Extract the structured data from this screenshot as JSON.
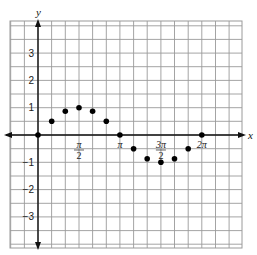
{
  "chart_data": {
    "type": "scatter",
    "title": "",
    "xlabel": "x",
    "ylabel": "y",
    "grid": true,
    "x_ticks": [
      {
        "value": 1.5708,
        "label_num": "π",
        "label_den": "2"
      },
      {
        "value": 3.1416,
        "label": "π"
      },
      {
        "value": 4.7124,
        "label_num": "3π",
        "label_den": "2"
      },
      {
        "value": 6.2832,
        "label": "2π"
      }
    ],
    "y_ticks": [
      {
        "value": 3,
        "label": "3"
      },
      {
        "value": 2,
        "label": "2"
      },
      {
        "value": 1,
        "label": "1"
      },
      {
        "value": -1,
        "label": "−1"
      },
      {
        "value": -2,
        "label": "−2"
      },
      {
        "value": -3,
        "label": "−3"
      }
    ],
    "series": [
      {
        "name": "points",
        "x": [
          0,
          0.5236,
          1.0472,
          1.5708,
          2.0944,
          2.618,
          3.1416,
          3.6652,
          4.1888,
          4.7124,
          5.236,
          5.7596,
          6.2832
        ],
        "y": [
          0,
          0.5,
          0.87,
          1,
          0.87,
          0.5,
          0,
          -0.5,
          -0.87,
          -1,
          -0.87,
          -0.5,
          0
        ]
      }
    ],
    "xlim": [
      -0.7,
      8.2
    ],
    "ylim": [
      -4.1,
      4.1
    ],
    "axis_color": "#111111",
    "grid_color": "#9a9a9a",
    "point_color": "#000000"
  }
}
